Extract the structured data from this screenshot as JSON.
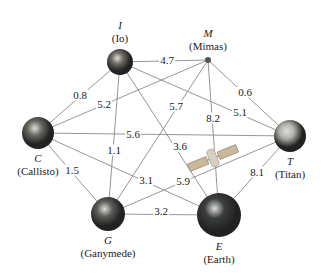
{
  "nodes": [
    {
      "id": "I",
      "letter": "I",
      "name": "(Io)",
      "x": 120,
      "y": 62,
      "r": 13,
      "color": "#6e6a62"
    },
    {
      "id": "M",
      "letter": "M",
      "name": "(Mimas)",
      "x": 208,
      "y": 60,
      "r": 3,
      "color": "#555"
    },
    {
      "id": "C",
      "letter": "C",
      "name": "(Callisto)",
      "x": 38,
      "y": 133,
      "r": 16,
      "color": "#6a6a64"
    },
    {
      "id": "T",
      "letter": "T",
      "name": "(Titan)",
      "x": 290,
      "y": 136,
      "r": 16,
      "color": "#b4b2ac"
    },
    {
      "id": "G",
      "letter": "G",
      "name": "(Ganymede)",
      "x": 108,
      "y": 214,
      "r": 17,
      "color": "#5e5c58"
    },
    {
      "id": "E",
      "letter": "E",
      "name": "(Earth)",
      "x": 219,
      "y": 215,
      "r": 22,
      "color": "#3b3f3c"
    }
  ],
  "edges": [
    {
      "from": "I",
      "to": "M",
      "weight": "4.7",
      "lx": 167,
      "ly": 60
    },
    {
      "from": "I",
      "to": "C",
      "weight": "0.8",
      "lx": 80,
      "ly": 95
    },
    {
      "from": "C",
      "to": "M",
      "weight": "5.2",
      "lx": 104,
      "ly": 104
    },
    {
      "from": "I",
      "to": "T",
      "weight": "5.1",
      "lx": 240,
      "ly": 112
    },
    {
      "from": "M",
      "to": "T",
      "weight": "0.6",
      "lx": 245,
      "ly": 92
    },
    {
      "from": "C",
      "to": "T",
      "weight": "5.6",
      "lx": 133,
      "ly": 134
    },
    {
      "from": "I",
      "to": "G",
      "weight": "1.1",
      "lx": 114,
      "ly": 150
    },
    {
      "from": "M",
      "to": "G",
      "weight": "5.7",
      "lx": 176,
      "ly": 106
    },
    {
      "from": "I",
      "to": "E",
      "weight": "3.6",
      "lx": 180,
      "ly": 146
    },
    {
      "from": "M",
      "to": "E",
      "weight": "8.2",
      "lx": 213,
      "ly": 118
    },
    {
      "from": "C",
      "to": "G",
      "weight": "1.5",
      "lx": 72,
      "ly": 170
    },
    {
      "from": "C",
      "to": "E",
      "weight": "3.1",
      "lx": 146,
      "ly": 180
    },
    {
      "from": "G",
      "to": "T",
      "weight": "5.9",
      "lx": 183,
      "ly": 181
    },
    {
      "from": "G",
      "to": "E",
      "weight": "3.2",
      "lx": 161,
      "ly": 211
    },
    {
      "from": "E",
      "to": "T",
      "weight": "8.1",
      "lx": 257,
      "ly": 172
    }
  ],
  "satellite": {
    "x": 213,
    "y": 158
  }
}
